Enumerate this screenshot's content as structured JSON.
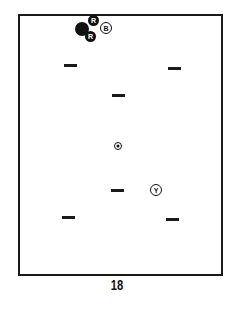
{
  "diagram": {
    "type": "billiards-table-layout",
    "page_number": "18",
    "balls": [
      {
        "id": "black",
        "label": "",
        "color": "#111111",
        "x": 82,
        "y": 29
      },
      {
        "id": "red-1",
        "label": "R",
        "color": "#111111",
        "x": 94,
        "y": 21
      },
      {
        "id": "red-2",
        "label": "R",
        "color": "#111111",
        "x": 91,
        "y": 37
      },
      {
        "id": "blue",
        "label": "B",
        "color": "#ffffff",
        "x": 106,
        "y": 28
      },
      {
        "id": "yellow",
        "label": "Y",
        "color": "#ffffff",
        "x": 156,
        "y": 190
      }
    ],
    "spot": {
      "x": 118,
      "y": 146
    },
    "markers": [
      {
        "x": 70,
        "y": 65
      },
      {
        "x": 174,
        "y": 68
      },
      {
        "x": 119,
        "y": 95
      },
      {
        "x": 117,
        "y": 190
      },
      {
        "x": 68,
        "y": 217
      },
      {
        "x": 172,
        "y": 219
      }
    ]
  }
}
